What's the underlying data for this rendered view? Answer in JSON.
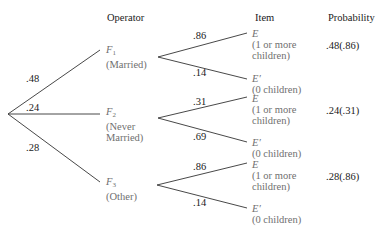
{
  "headers": {
    "operator": "Operator",
    "item": "Item",
    "probability": "Probability"
  },
  "level1": [
    {
      "prob": ".48",
      "symbol": "F",
      "sub": "1",
      "desc": [
        "(Married)"
      ]
    },
    {
      "prob": ".24",
      "symbol": "F",
      "sub": "2",
      "desc": [
        "(Never",
        "Married)"
      ]
    },
    {
      "prob": ".28",
      "symbol": "F",
      "sub": "3",
      "desc": [
        "(Other)"
      ]
    }
  ],
  "level2": [
    {
      "upper_prob": ".86",
      "lower_prob": ".14"
    },
    {
      "upper_prob": ".31",
      "lower_prob": ".69"
    },
    {
      "upper_prob": ".86",
      "lower_prob": ".14"
    }
  ],
  "items": {
    "E": {
      "symbol": "E",
      "desc": [
        "(1 or more",
        "children)"
      ]
    },
    "E_prime": {
      "symbol": "E′",
      "desc": [
        "(0 children)"
      ]
    }
  },
  "results": [
    ".48(.86)",
    ".24(.31)",
    ".28(.86)"
  ],
  "colors": {
    "line": "#333333",
    "text": "#1a1a1a",
    "label": "#6f6f6f"
  }
}
